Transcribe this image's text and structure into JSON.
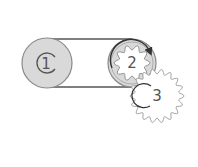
{
  "diagram": {
    "type": "belt-and-gear-train",
    "components": [
      {
        "id": "1",
        "label": "1",
        "kind": "pulley",
        "center": [
          47,
          63
        ],
        "radius": 25,
        "fill": "#d9d9d9",
        "stroke": "#8a8a8a"
      },
      {
        "id": "2",
        "label": "2",
        "kind": "pulley-with-gear",
        "center": [
          132,
          63
        ],
        "radius": 24,
        "fill": "#d9d9d9",
        "stroke": "#8a8a8a",
        "gear_teeth": 10
      },
      {
        "id": "3",
        "label": "3",
        "kind": "gear",
        "center": [
          157,
          96
        ],
        "radius": 27,
        "fill": "#ffffff",
        "stroke": "#9a9a9a",
        "gear_teeth": 18
      }
    ],
    "belt": {
      "connects": [
        "1",
        "2"
      ],
      "stroke": "#555555"
    },
    "arrows": [
      {
        "on": "1",
        "shape": "open-arc"
      },
      {
        "on": "2",
        "shape": "arc-arrow-clockwise"
      },
      {
        "on": "3",
        "shape": "open-arc"
      }
    ]
  }
}
